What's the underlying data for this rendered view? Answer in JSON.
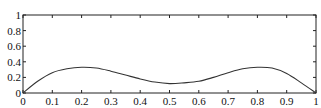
{
  "chart_data": {
    "type": "line",
    "title": "",
    "xlabel": "",
    "ylabel": "",
    "xlim": [
      0,
      1
    ],
    "ylim": [
      0,
      1
    ],
    "grid": false,
    "legend": null,
    "x_ticks": [
      "0",
      "0.1",
      "0.2",
      "0.3",
      "0.4",
      "0.5",
      "0.6",
      "0.7",
      "0.8",
      "0.9",
      "1"
    ],
    "y_ticks": [
      "0",
      "0.2",
      "0.4",
      "0.6",
      "0.8",
      "1"
    ],
    "series": [
      {
        "name": "curve",
        "color": "#333333",
        "x": [
          0,
          0.05,
          0.1,
          0.15,
          0.2,
          0.25,
          0.3,
          0.35,
          0.4,
          0.45,
          0.5,
          0.55,
          0.6,
          0.65,
          0.7,
          0.75,
          0.8,
          0.85,
          0.9,
          0.95,
          1.0
        ],
        "y": [
          0,
          0.15,
          0.26,
          0.31,
          0.33,
          0.32,
          0.28,
          0.23,
          0.18,
          0.14,
          0.12,
          0.13,
          0.15,
          0.2,
          0.26,
          0.31,
          0.33,
          0.32,
          0.25,
          0.13,
          0
        ]
      }
    ]
  },
  "plot": {
    "left": 23,
    "right": 316,
    "top": 15,
    "bottom": 93
  }
}
